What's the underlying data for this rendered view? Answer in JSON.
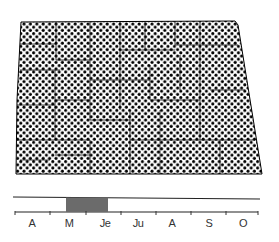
{
  "map": {
    "region": "state-outline",
    "fill_pattern": "halftone-dots",
    "dot_color": "#000000",
    "background_color": "#ffffff",
    "outline": [
      [
        21,
        22
      ],
      [
        235,
        21
      ],
      [
        238,
        25
      ],
      [
        262,
        174
      ],
      [
        16,
        174
      ],
      [
        17,
        100
      ],
      [
        21,
        22
      ]
    ]
  },
  "timeline": {
    "months": [
      {
        "label": "A",
        "x": 32
      },
      {
        "label": "M",
        "x": 69
      },
      {
        "label": "Je",
        "x": 105
      },
      {
        "label": "Ju",
        "x": 138
      },
      {
        "label": "A",
        "x": 172
      },
      {
        "label": "S",
        "x": 209
      },
      {
        "label": "O",
        "x": 243
      }
    ],
    "ticks_x": [
      15,
      50,
      86,
      121,
      156,
      191,
      226,
      258
    ],
    "highlight": {
      "start_label": "M",
      "end_label": "Je",
      "x_start": 66,
      "x_end": 108,
      "color": "#6b6b6b"
    },
    "line_color": "#222222"
  }
}
